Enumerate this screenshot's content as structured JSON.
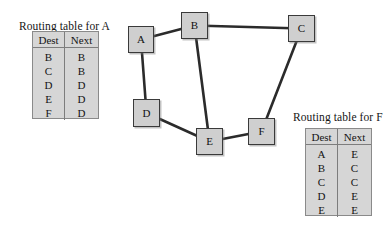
{
  "diagram": {
    "kind": "network-routing-diagram",
    "background_color": "#ffffff",
    "node_fill_color": "#cfcfcf",
    "node_border_color": "#3a3a3a",
    "edge_color": "#2b2b2b",
    "table_fill_color": "#d6d6d6",
    "table_border_color": "#8a8a8a"
  },
  "tables": [
    {
      "id": "routing-table-a",
      "title": "Routing table for A",
      "columns": [
        "Dest",
        "Next"
      ],
      "rows": [
        {
          "dest": "B",
          "next": "B"
        },
        {
          "dest": "C",
          "next": "B"
        },
        {
          "dest": "D",
          "next": "D"
        },
        {
          "dest": "E",
          "next": "D"
        },
        {
          "dest": "F",
          "next": "D"
        }
      ]
    },
    {
      "id": "routing-table-f",
      "title": "Routing table for F",
      "columns": [
        "Dest",
        "Next"
      ],
      "rows": [
        {
          "dest": "A",
          "next": "E"
        },
        {
          "dest": "B",
          "next": "C"
        },
        {
          "dest": "C",
          "next": "C"
        },
        {
          "dest": "D",
          "next": "E"
        },
        {
          "dest": "E",
          "next": "E"
        }
      ]
    }
  ],
  "graph": {
    "nodes": [
      {
        "id": "A",
        "label": "A",
        "x": 128,
        "y": 26,
        "w": 26,
        "h": 27
      },
      {
        "id": "B",
        "label": "B",
        "x": 181,
        "y": 12,
        "w": 27,
        "h": 27
      },
      {
        "id": "C",
        "label": "C",
        "x": 288,
        "y": 15,
        "w": 27,
        "h": 27
      },
      {
        "id": "D",
        "label": "D",
        "x": 133,
        "y": 99,
        "w": 27,
        "h": 28
      },
      {
        "id": "E",
        "label": "E",
        "x": 196,
        "y": 128,
        "w": 27,
        "h": 27
      },
      {
        "id": "F",
        "label": "F",
        "x": 248,
        "y": 118,
        "w": 27,
        "h": 27
      }
    ],
    "edges": [
      {
        "from": "A",
        "to": "B"
      },
      {
        "from": "B",
        "to": "C"
      },
      {
        "from": "A",
        "to": "D"
      },
      {
        "from": "B",
        "to": "E"
      },
      {
        "from": "D",
        "to": "E"
      },
      {
        "from": "E",
        "to": "F"
      },
      {
        "from": "C",
        "to": "F"
      }
    ]
  }
}
